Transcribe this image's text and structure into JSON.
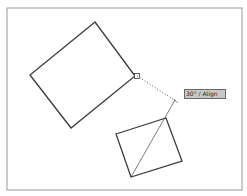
{
  "diagram": {
    "frame": {
      "x1": 7,
      "y1": 8,
      "x2": 242,
      "y2": 190,
      "color": "#9a9a9a"
    },
    "large_rectangle": {
      "points": [
        [
          95,
          22
        ],
        [
          30,
          75
        ],
        [
          71,
          128
        ],
        [
          135,
          76
        ]
      ],
      "color": "#3a3a3a"
    },
    "snap_marker": {
      "x": 137,
      "y": 76,
      "size": 5
    },
    "tracking_line": {
      "from": [
        137,
        76
      ],
      "to": [
        176,
        101
      ],
      "style": "dotted"
    },
    "small_square": {
      "points": [
        [
          116,
          134
        ],
        [
          166,
          118
        ],
        [
          182,
          161
        ],
        [
          131,
          177
        ]
      ],
      "color": "#3a3a3a"
    },
    "diagonal_line": {
      "from": [
        131,
        177
      ],
      "to": [
        175,
        100
      ]
    },
    "tooltip": {
      "angle": "30°",
      "separator": " / ",
      "label": "Align",
      "text": "30° / Align"
    }
  }
}
